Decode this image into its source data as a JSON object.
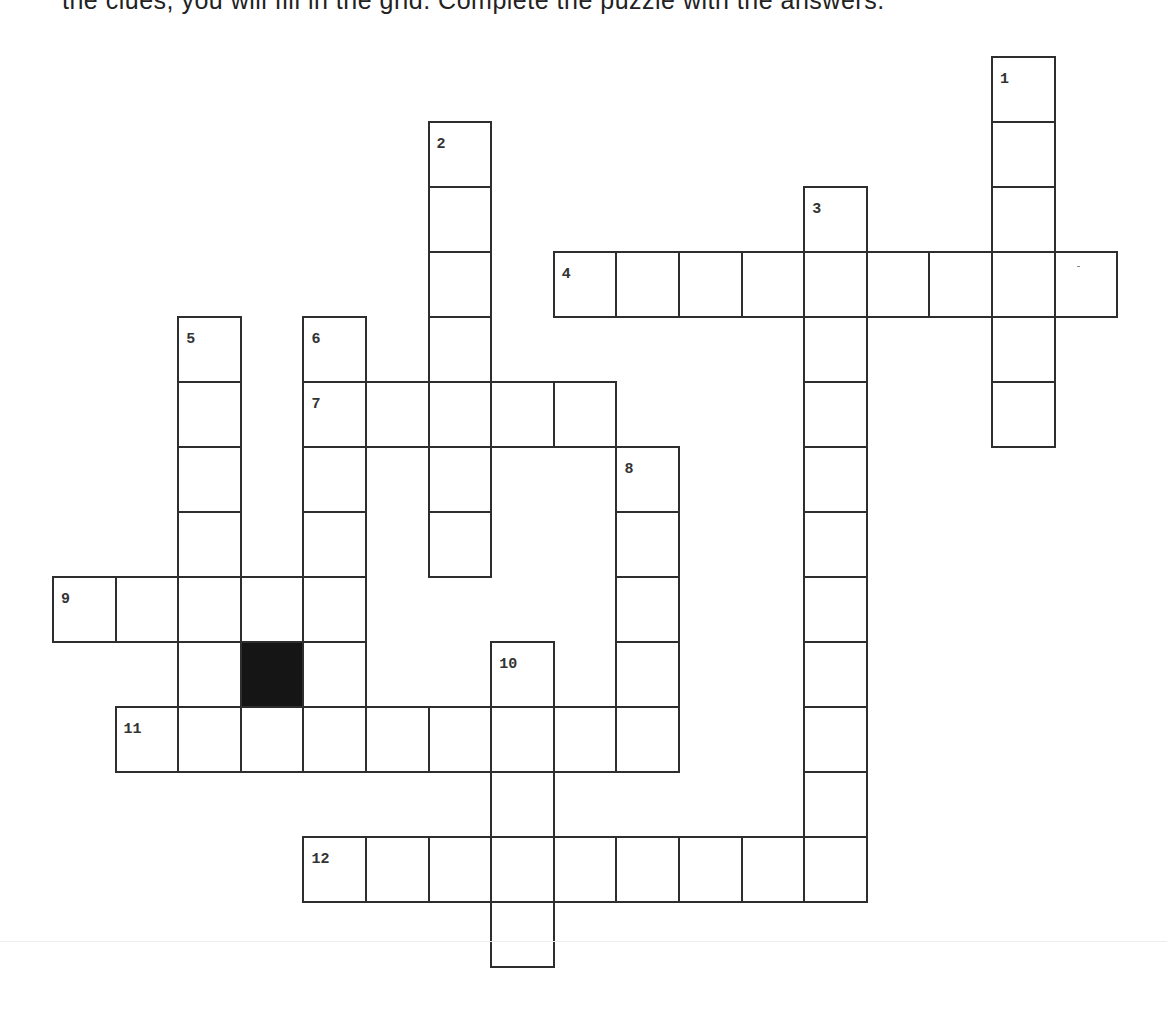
{
  "page": {
    "intro_text_clipped": "the clues, you will fill in the grid. Complete the puzzle with the answers.",
    "background": "#ffffff",
    "line_color": "#2e2e2e",
    "block_color": "#151515"
  },
  "grid_geometry": {
    "origin_x": 53,
    "origin_y": 57,
    "col_step": 62.6,
    "row_step": 65,
    "rows": 14,
    "cols": 17
  },
  "clue_numbers": {
    "n1": "1",
    "n2": "2",
    "n3": "3",
    "n4": "4",
    "n5": "5",
    "n6": "6",
    "n7": "7",
    "n8": "8",
    "n9": "9",
    "n10": "10",
    "n11": "11",
    "n12": "12"
  },
  "entries": [
    {
      "number": "1",
      "direction": "down",
      "row": 0,
      "col": 15,
      "length": 6
    },
    {
      "number": "2",
      "direction": "down",
      "row": 1,
      "col": 6,
      "length": 7
    },
    {
      "number": "3",
      "direction": "down",
      "row": 2,
      "col": 12,
      "length": 11
    },
    {
      "number": "4",
      "direction": "across",
      "row": 3,
      "col": 8,
      "length": 9
    },
    {
      "number": "5",
      "direction": "down",
      "row": 4,
      "col": 2,
      "length": 7
    },
    {
      "number": "6",
      "direction": "down",
      "row": 4,
      "col": 4,
      "length": 7
    },
    {
      "number": "7",
      "direction": "across",
      "row": 5,
      "col": 4,
      "length": 5
    },
    {
      "number": "8",
      "direction": "down",
      "row": 6,
      "col": 9,
      "length": 5
    },
    {
      "number": "9",
      "direction": "across",
      "row": 8,
      "col": 0,
      "length": 5
    },
    {
      "number": "10",
      "direction": "down",
      "row": 9,
      "col": 7,
      "length": 5
    },
    {
      "number": "11",
      "direction": "across",
      "row": 10,
      "col": 1,
      "length": 9
    },
    {
      "number": "12",
      "direction": "across",
      "row": 12,
      "col": 4,
      "length": 9
    }
  ],
  "blocked_cells": [
    {
      "row": 9,
      "col": 3
    }
  ]
}
